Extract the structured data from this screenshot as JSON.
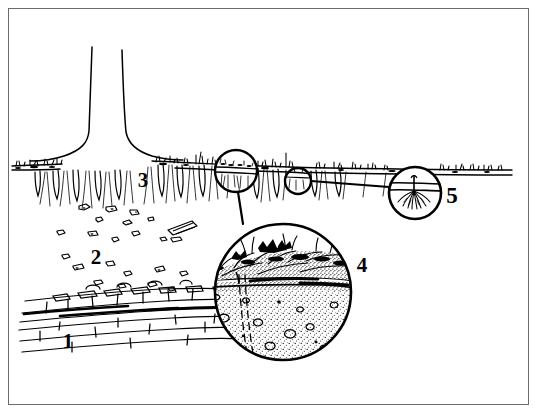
{
  "figure": {
    "type": "soil-profile-line-drawing",
    "style": "black-and-white ink line drawing",
    "border_color": "#6b6b6b",
    "ink_color": "#000000",
    "background_color": "#ffffff",
    "width": 539,
    "height": 415
  },
  "labels": [
    {
      "id": "1",
      "text": "1",
      "x": 68,
      "y": 348,
      "refers_to": "bedrock / stratified rock layer"
    },
    {
      "id": "2",
      "text": "2",
      "x": 96,
      "y": 264,
      "refers_to": "rubble / coarse fragment zone"
    },
    {
      "id": "3",
      "text": "3",
      "x": 143,
      "y": 187,
      "refers_to": "root zone below ground surface"
    },
    {
      "id": "4",
      "text": "4",
      "x": 362,
      "y": 272,
      "refers_to": "magnified soil horizon detail"
    },
    {
      "id": "5",
      "text": "5",
      "x": 452,
      "y": 203,
      "refers_to": "magnified seedling root detail"
    }
  ],
  "callouts": [
    {
      "name": "callout-ground-surface",
      "cx": 236,
      "cy": 171,
      "r": 21,
      "links_to": "4"
    },
    {
      "name": "callout-small-surface",
      "cx": 298,
      "cy": 181,
      "r": 13,
      "links_to": "5"
    },
    {
      "name": "callout-detail-large",
      "cx": 283,
      "cy": 292,
      "r": 68,
      "label": "4"
    },
    {
      "name": "callout-seedling",
      "cx": 415,
      "cy": 193,
      "r": 26,
      "label": "5"
    }
  ],
  "elements": {
    "tree_trunk": "tapering trunk flaring into root buttress at ground line",
    "ground_line": "horizontal surface line with sparse grass tufts",
    "grass": "short sparse tufts along the surface",
    "root_columns": "vertical soil columns with fine roots hanging below surface",
    "rock_fragments": "scattered angular clasts in the rubble zone",
    "bedrock": "horizontally bedded / bricked rock strata",
    "detail_litter": "dark organic litter and vegetation mat at top of magnified circle",
    "detail_horizon": "sharp horizon boundary line",
    "detail_mineral": "stippled mineral soil with pebbles",
    "detail_crack": "dashed near-vertical crack or root channel"
  }
}
